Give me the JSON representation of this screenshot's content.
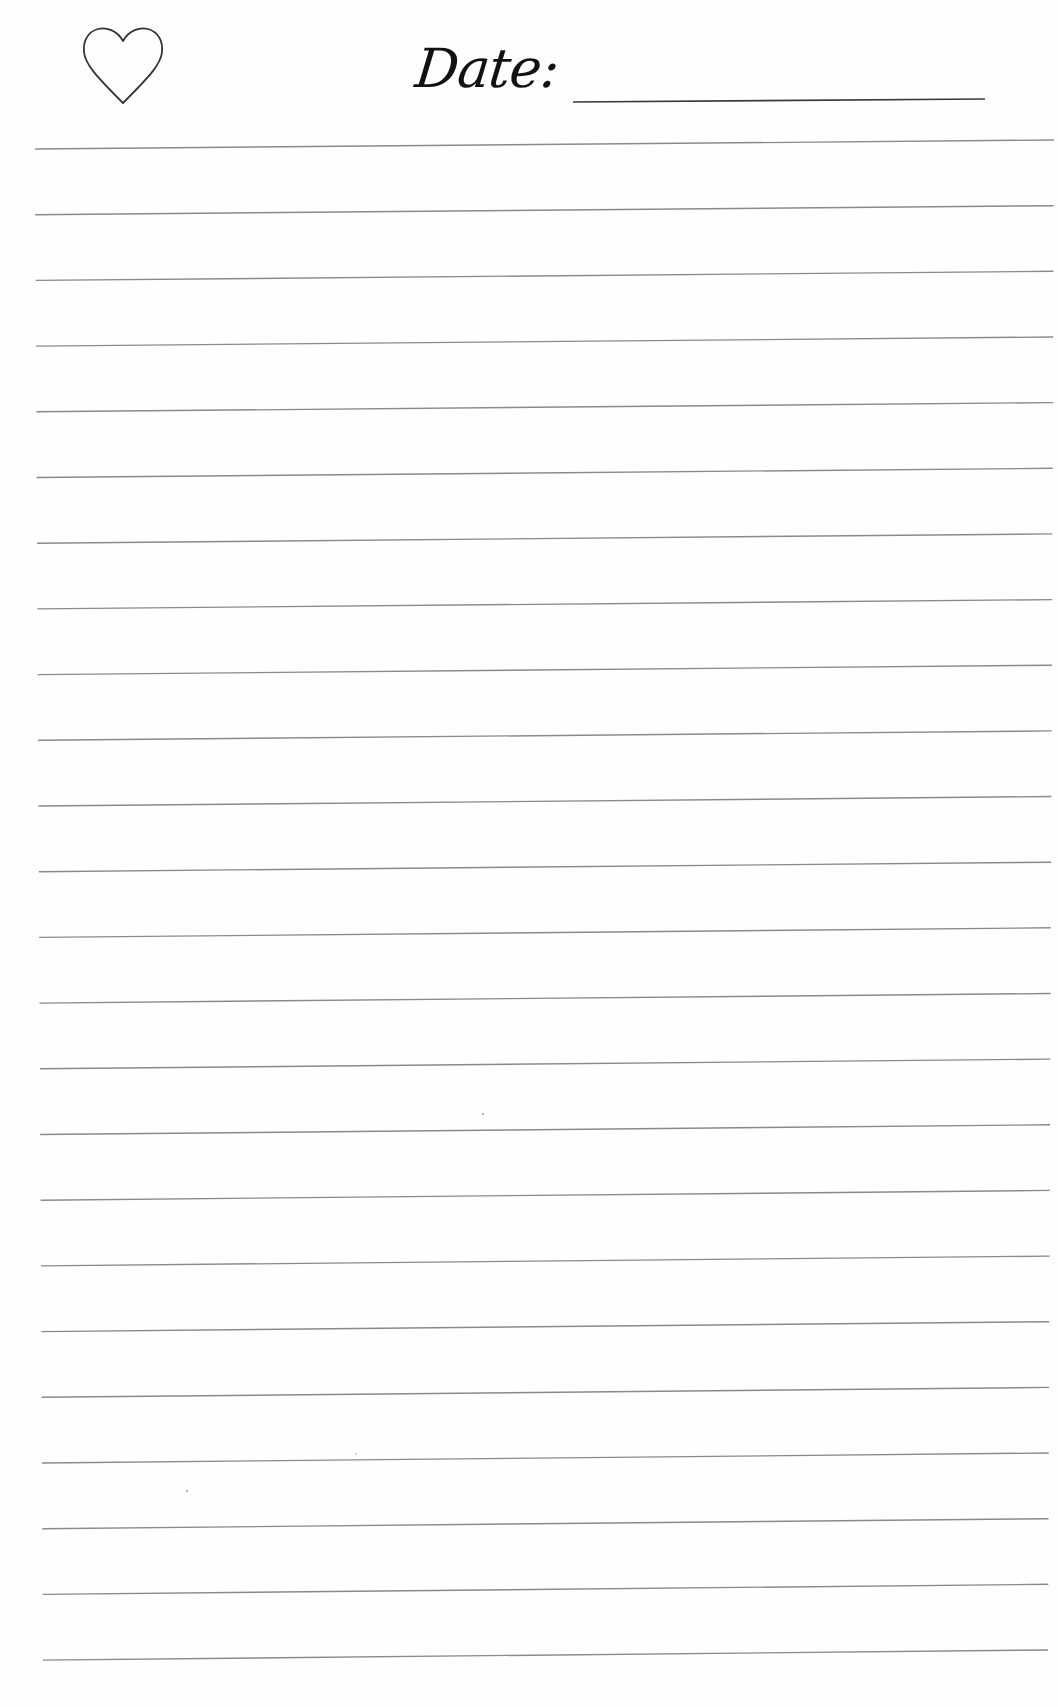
{
  "header": {
    "icon": "heart-outline-icon",
    "date_label": "Date:",
    "date_value": "",
    "date_placeholder": ""
  },
  "ruling": {
    "line_count": 24,
    "line_spacing_px": 65.7,
    "line_color": "#8a8a8a",
    "underline_color": "#3a3a3a",
    "first_line_left_y": 149,
    "first_line_right_y": 140,
    "left_x_top": 35,
    "left_x_bottom": 43,
    "right_x_top": 1054,
    "right_x_bottom": 1048
  },
  "colors": {
    "paper": "#fefefe",
    "ink": "#111111",
    "heart_stroke": "#333333"
  },
  "body": {
    "content": ""
  }
}
